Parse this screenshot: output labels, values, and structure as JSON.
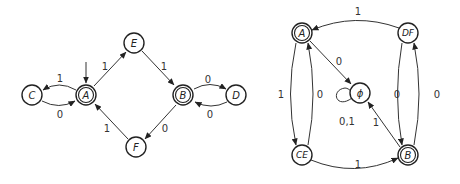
{
  "diagrams": [
    {
      "name": "nfa-left",
      "states": [
        {
          "id": "C",
          "label": "C",
          "accepting": false,
          "start": false
        },
        {
          "id": "A",
          "label": "A",
          "accepting": true,
          "start": true
        },
        {
          "id": "E",
          "label": "E",
          "accepting": false,
          "start": false
        },
        {
          "id": "B",
          "label": "B",
          "accepting": true,
          "start": false
        },
        {
          "id": "D",
          "label": "D",
          "accepting": false,
          "start": false
        },
        {
          "id": "F",
          "label": "F",
          "accepting": false,
          "start": false
        }
      ],
      "transitions": [
        {
          "from": "A",
          "to": "C",
          "label": "1"
        },
        {
          "from": "C",
          "to": "A",
          "label": "0"
        },
        {
          "from": "A",
          "to": "E",
          "label": "1"
        },
        {
          "from": "E",
          "to": "B",
          "label": "1"
        },
        {
          "from": "B",
          "to": "D",
          "label": "0"
        },
        {
          "from": "D",
          "to": "B",
          "label": "0"
        },
        {
          "from": "B",
          "to": "F",
          "label": "0"
        },
        {
          "from": "F",
          "to": "A",
          "label": "1"
        }
      ]
    },
    {
      "name": "dfa-right",
      "states": [
        {
          "id": "A",
          "label": "A",
          "accepting": true
        },
        {
          "id": "DF",
          "label": "DF",
          "accepting": false
        },
        {
          "id": "empty",
          "label": "ϕ",
          "accepting": false
        },
        {
          "id": "CE",
          "label": "CE",
          "accepting": false
        },
        {
          "id": "B",
          "label": "B",
          "accepting": true
        }
      ],
      "transitions": [
        {
          "from": "DF",
          "to": "A",
          "label": "1"
        },
        {
          "from": "A",
          "to": "empty",
          "label": "0"
        },
        {
          "from": "A",
          "to": "CE",
          "label": "1"
        },
        {
          "from": "CE",
          "to": "A",
          "label": "0"
        },
        {
          "from": "empty",
          "to": "empty",
          "label": "0,1"
        },
        {
          "from": "B",
          "to": "empty",
          "label": "1"
        },
        {
          "from": "DF",
          "to": "B",
          "label": "0"
        },
        {
          "from": "B",
          "to": "DF",
          "label": "0"
        },
        {
          "from": "CE",
          "to": "B",
          "label": "1"
        }
      ]
    }
  ]
}
